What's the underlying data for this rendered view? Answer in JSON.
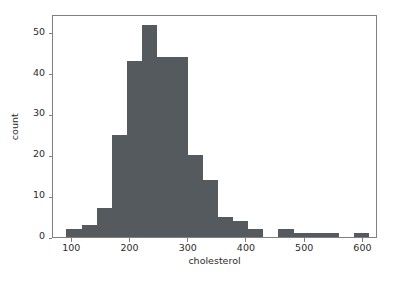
{
  "chart_data": {
    "type": "bar",
    "subtype": "histogram",
    "title": "",
    "xlabel": "cholesterol",
    "ylabel": "count",
    "xlim": [
      67,
      625
    ],
    "ylim": [
      0,
      54.6
    ],
    "grid": false,
    "legend": null,
    "bar_color": "#555a5f",
    "bin_width": 26,
    "xticks": [
      100,
      200,
      300,
      400,
      500,
      600
    ],
    "xtick_labels": [
      "100",
      "200",
      "300",
      "400",
      "500",
      "600"
    ],
    "yticks": [
      0,
      10,
      20,
      30,
      40,
      50
    ],
    "ytick_labels": [
      "0",
      "10",
      "20",
      "30",
      "40",
      "50"
    ],
    "bins": [
      {
        "x0": 90,
        "x1": 116,
        "count": 2
      },
      {
        "x0": 116,
        "x1": 142,
        "count": 3
      },
      {
        "x0": 142,
        "x1": 168,
        "count": 7
      },
      {
        "x0": 168,
        "x1": 194,
        "count": 25
      },
      {
        "x0": 194,
        "x1": 220,
        "count": 43
      },
      {
        "x0": 220,
        "x1": 246,
        "count": 52
      },
      {
        "x0": 246,
        "x1": 272,
        "count": 44
      },
      {
        "x0": 272,
        "x1": 298,
        "count": 44
      },
      {
        "x0": 298,
        "x1": 324,
        "count": 20
      },
      {
        "x0": 324,
        "x1": 350,
        "count": 14
      },
      {
        "x0": 350,
        "x1": 376,
        "count": 5
      },
      {
        "x0": 376,
        "x1": 402,
        "count": 4
      },
      {
        "x0": 402,
        "x1": 428,
        "count": 2
      },
      {
        "x0": 428,
        "x1": 454,
        "count": 0
      },
      {
        "x0": 454,
        "x1": 480,
        "count": 2
      },
      {
        "x0": 480,
        "x1": 506,
        "count": 1
      },
      {
        "x0": 506,
        "x1": 532,
        "count": 1
      },
      {
        "x0": 532,
        "x1": 558,
        "count": 1
      },
      {
        "x0": 558,
        "x1": 584,
        "count": 0
      },
      {
        "x0": 584,
        "x1": 610,
        "count": 1
      }
    ],
    "categories": [
      "90-116",
      "116-142",
      "142-168",
      "168-194",
      "194-220",
      "220-246",
      "246-272",
      "272-298",
      "298-324",
      "324-350",
      "350-376",
      "376-402",
      "402-428",
      "428-454",
      "454-480",
      "480-506",
      "506-532",
      "532-558",
      "558-584",
      "584-610"
    ],
    "values": [
      2,
      3,
      7,
      25,
      43,
      52,
      44,
      44,
      20,
      14,
      5,
      4,
      2,
      0,
      2,
      1,
      1,
      1,
      0,
      1
    ]
  }
}
